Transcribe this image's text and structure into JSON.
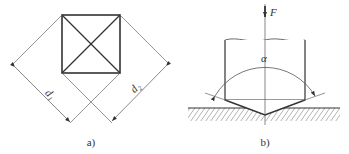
{
  "figure_a": {
    "caption": "a)",
    "dim_labels": {
      "d1": "d₁",
      "d2": "d₂"
    }
  },
  "figure_b": {
    "caption": "b)",
    "force_label": "F",
    "angle_label": "α"
  },
  "colors": {
    "line": "#333333",
    "thin": "#555555",
    "background": "#ffffff"
  }
}
